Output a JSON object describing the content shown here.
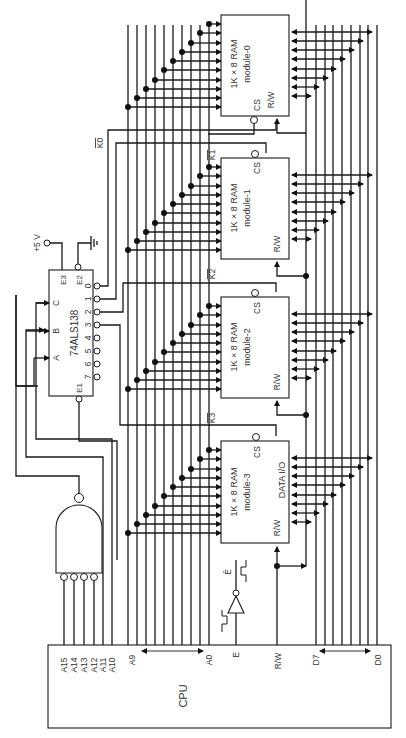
{
  "diagram": {
    "type": "memory-decoder-schematic",
    "orientation": "rotated-90-ccw"
  },
  "cpu": {
    "label": "CPU",
    "address_pins": [
      "A15",
      "A14",
      "A13",
      "A12",
      "A11",
      "A10",
      "A9",
      "A0"
    ],
    "address_labels": {
      "a15": "A15",
      "a14": "A14",
      "a13": "A13",
      "a12": "A12",
      "a11": "A11",
      "a10": "A10",
      "a9": "A9",
      "a0": "A0"
    },
    "enable_label": "E",
    "rw_label": "R/W",
    "data_labels": {
      "d7": "D7",
      "d0": "D0"
    }
  },
  "decoder": {
    "part": "74ALS138",
    "inputs": {
      "a": "A",
      "b": "B",
      "c": "C"
    },
    "enables": {
      "e1": "E1",
      "e2": "E2",
      "e3": "E3"
    },
    "outputs": [
      "0",
      "1",
      "2",
      "3",
      "4",
      "5",
      "6",
      "7"
    ]
  },
  "power": {
    "vcc_label": "+5 V"
  },
  "inverter": {
    "output_label": "Ē"
  },
  "chip_selects": [
    {
      "label": "K0"
    },
    {
      "label": "K1"
    },
    {
      "label": "K2"
    },
    {
      "label": "K3"
    }
  ],
  "ram_modules": [
    {
      "title": "1K × 8 RAM",
      "name": "module-0",
      "cs": "CS",
      "rw": "R/W",
      "data": ""
    },
    {
      "title": "1K × 8 RAM",
      "name": "module-1",
      "cs": "CS",
      "rw": "R/W",
      "data": ""
    },
    {
      "title": "1K × 8 RAM",
      "name": "module-2",
      "cs": "CS",
      "rw": "R/W",
      "data": ""
    },
    {
      "title": "1K × 8 RAM",
      "name": "module-3",
      "cs": "CS",
      "rw": "R/W",
      "data": "DATA I/O"
    }
  ],
  "gate": {
    "type": "NAND",
    "inputs": 4
  }
}
